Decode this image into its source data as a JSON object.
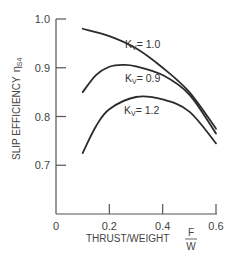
{
  "chart_data": {
    "type": "line",
    "title": "",
    "xlabel": "THRUST/WEIGHT",
    "xlabel_fraction": {
      "numerator": "F",
      "denominator": "W"
    },
    "ylabel": "SLIP EFFICIENCY",
    "ylabel_symbol": "η",
    "ylabel_subscript": "S4",
    "xlim": [
      0,
      0.6
    ],
    "ylim": [
      0.6,
      1.0
    ],
    "x_ticks": [
      "0",
      "0.2",
      "0.4",
      "0.6"
    ],
    "y_ticks": [
      "1.0",
      "0.9",
      "0.8",
      "0.7"
    ],
    "grid": false,
    "legend": "inline labels",
    "series": [
      {
        "name": "Kv = 1.0",
        "label_main": "K",
        "label_sub": "V",
        "label_value": "= 1.0",
        "x": [
          0.1,
          0.2,
          0.3,
          0.4,
          0.5,
          0.6
        ],
        "values": [
          0.98,
          0.965,
          0.94,
          0.9,
          0.85,
          0.775
        ]
      },
      {
        "name": "Kv = 0.9",
        "label_main": "K",
        "label_sub": "V",
        "label_value": "= 0.9",
        "x": [
          0.1,
          0.15,
          0.2,
          0.25,
          0.3,
          0.4,
          0.5,
          0.6
        ],
        "values": [
          0.85,
          0.885,
          0.902,
          0.906,
          0.903,
          0.885,
          0.845,
          0.765
        ]
      },
      {
        "name": "Kv = 1.2",
        "label_main": "K",
        "label_sub": "V",
        "label_value": "= 1.2",
        "x": [
          0.1,
          0.15,
          0.2,
          0.3,
          0.4,
          0.5,
          0.6
        ],
        "values": [
          0.725,
          0.78,
          0.815,
          0.84,
          0.835,
          0.81,
          0.745
        ]
      }
    ]
  }
}
